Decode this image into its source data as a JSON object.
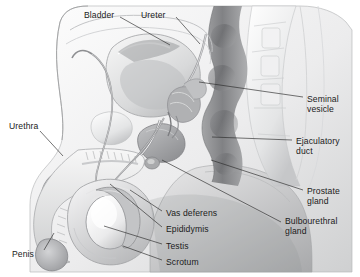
{
  "figure": {
    "style": "grayscale medical illustration",
    "width": 360,
    "height": 277,
    "background_color": "#ffffff",
    "ink_color": "#1b1b1b",
    "label_font_size_px": 8.6
  },
  "labels": [
    {
      "id": "bladder",
      "text": "Bladder",
      "x": 84,
      "y": 10,
      "align": "left"
    },
    {
      "id": "ureter",
      "text": "Ureter",
      "x": 141,
      "y": 10,
      "align": "left"
    },
    {
      "id": "seminal_vesicle",
      "text": "Seminal\nvesicle",
      "x": 307,
      "y": 94,
      "align": "left"
    },
    {
      "id": "ejaculatory_duct",
      "text": "Ejaculatory\nduct",
      "x": 296,
      "y": 136,
      "align": "left"
    },
    {
      "id": "prostate_gland",
      "text": "Prostate\ngland",
      "x": 307,
      "y": 186,
      "align": "left"
    },
    {
      "id": "bulbourethral_gland",
      "text": "Bulbourethral\ngland",
      "x": 285,
      "y": 216,
      "align": "left"
    },
    {
      "id": "urethra",
      "text": "Urethra",
      "x": 9,
      "y": 121,
      "align": "left"
    },
    {
      "id": "penis",
      "text": "Penis",
      "x": 12,
      "y": 249,
      "align": "left"
    },
    {
      "id": "vas_deferens",
      "text": "Vas deferens",
      "x": 166,
      "y": 208,
      "align": "left"
    },
    {
      "id": "epididymis",
      "text": "Epididymis",
      "x": 166,
      "y": 224,
      "align": "left"
    },
    {
      "id": "testis",
      "text": "Testis",
      "x": 166,
      "y": 241,
      "align": "left"
    },
    {
      "id": "scrotum",
      "text": "Scrotum",
      "x": 166,
      "y": 257,
      "align": "left"
    }
  ],
  "leader_lines": [
    {
      "id": "bladder-leader",
      "points": "120,17 170,45"
    },
    {
      "id": "ureter-leader",
      "points": "176,17 198,42"
    },
    {
      "id": "seminal-vesicle-leader",
      "points": "303,97 199,82"
    },
    {
      "id": "ejaculatory-duct-leader",
      "points": "292,140 212,137"
    },
    {
      "id": "prostate-gland-leader",
      "points": "303,190 211,160"
    },
    {
      "id": "bulbourethral-gland-leader",
      "points": "281,222 162,159"
    },
    {
      "id": "urethra-leader",
      "points": "40,131 62,154"
    },
    {
      "id": "penis-leader",
      "points": "44,250 54,234"
    },
    {
      "id": "vas-deferens-leader",
      "points": "162,211 131,190"
    },
    {
      "id": "epididymis-leader",
      "points": "162,227 111,185"
    },
    {
      "id": "testis-leader",
      "points": "162,244 104,227"
    },
    {
      "id": "scrotum-leader",
      "points": "162,260 124,247"
    }
  ],
  "anatomy_parts": [
    "bladder",
    "ureter",
    "seminal vesicle",
    "ejaculatory duct",
    "prostate gland",
    "bulbourethral gland",
    "urethra",
    "penis",
    "vas deferens",
    "epididymis",
    "testis",
    "scrotum",
    "vertebral column",
    "rectum",
    "pubic bone"
  ]
}
